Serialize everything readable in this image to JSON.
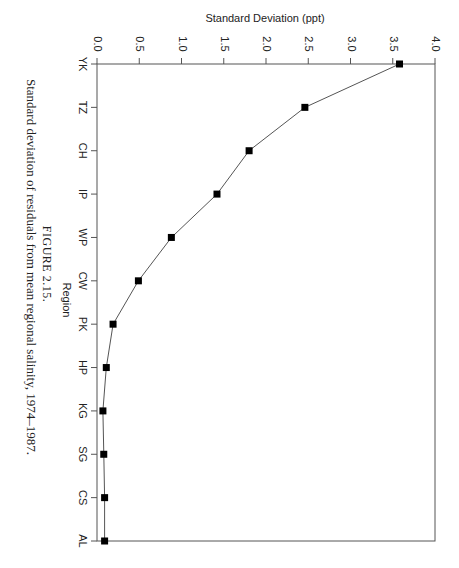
{
  "orientation": "rotated-90-clockwise",
  "figure": {
    "number_label": "FIGURE 2.15.",
    "caption": "Standard deviation of residuals from mean regional salinity, 1974–1987."
  },
  "chart_data": {
    "type": "line",
    "title": "",
    "xlabel": "Region",
    "ylabel": "Standard Deviation (ppt)",
    "categories": [
      "YK",
      "TZ",
      "CH",
      "IP",
      "WP",
      "CW",
      "PK",
      "HP",
      "KG",
      "SG",
      "CS",
      "AL"
    ],
    "series": [
      {
        "name": "Standard Deviation",
        "marker": "square",
        "values": [
          3.58,
          2.46,
          1.8,
          1.42,
          0.88,
          0.49,
          0.19,
          0.11,
          0.07,
          0.08,
          0.09,
          0.09
        ]
      }
    ],
    "ylim": [
      0.0,
      4.0
    ],
    "yticks": [
      "0.0",
      "0.5",
      "1.0",
      "1.5",
      "2.0",
      "2.5",
      "3.0",
      "3.5",
      "4.0"
    ],
    "grid": false,
    "legend": "none",
    "frame": true
  },
  "colors": {
    "line": "#555555",
    "marker": "#000000",
    "axis": "#555555",
    "text": "#222222"
  }
}
